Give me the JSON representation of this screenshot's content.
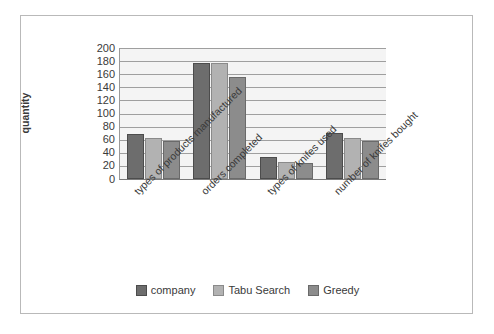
{
  "chart_data": {
    "type": "bar",
    "title": "",
    "xlabel": "",
    "ylabel": "quantity",
    "ylim": [
      0,
      200
    ],
    "ytick_step": 20,
    "yticks": [
      200,
      180,
      160,
      140,
      120,
      100,
      80,
      60,
      40,
      20,
      0
    ],
    "grid": true,
    "legend_position": "bottom",
    "categories": [
      "types of products manufactured",
      "orders completed",
      "types of knifes used",
      "number of knifes bought"
    ],
    "series": [
      {
        "name": "company",
        "color": "#6d6d6d",
        "values": [
          69,
          177,
          34,
          71
        ]
      },
      {
        "name": "Tabu Search",
        "color": "#b2b2b2",
        "values": [
          63,
          177,
          26,
          63
        ]
      },
      {
        "name": "Greedy",
        "color": "#8c8c8c",
        "values": [
          58,
          155,
          25,
          58
        ]
      }
    ]
  },
  "legend": {
    "items": [
      {
        "label": "company"
      },
      {
        "label": "Tabu Search"
      },
      {
        "label": "Greedy"
      }
    ]
  },
  "axis": {
    "y_title": "quantity"
  }
}
